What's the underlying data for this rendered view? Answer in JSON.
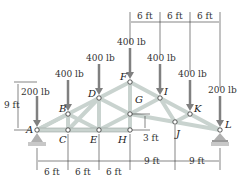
{
  "diagram": {
    "type": "truss",
    "nodes": {
      "A": {
        "label": "A",
        "x": 37,
        "y": 130
      },
      "B": {
        "label": "B",
        "x": 68,
        "y": 114
      },
      "C": {
        "label": "C",
        "x": 68,
        "y": 130
      },
      "D": {
        "label": "D",
        "x": 99,
        "y": 98
      },
      "E": {
        "label": "E",
        "x": 99,
        "y": 130
      },
      "F": {
        "label": "F",
        "x": 130,
        "y": 82
      },
      "G": {
        "label": "G",
        "x": 130,
        "y": 114
      },
      "H": {
        "label": "H",
        "x": 130,
        "y": 130
      },
      "I": {
        "label": "I",
        "x": 160,
        "y": 98
      },
      "J": {
        "label": "J",
        "x": 175,
        "y": 122
      },
      "K": {
        "label": "K",
        "x": 190,
        "y": 114
      },
      "L": {
        "label": "L",
        "x": 220,
        "y": 130
      }
    },
    "loads": {
      "A": "200 lb",
      "B": "400 lb",
      "D": "400 lb",
      "F": "400 lb",
      "I": "400 lb",
      "K": "400 lb",
      "L": "200 lb"
    },
    "dimensions": {
      "bottom_left": [
        "6 ft",
        "6 ft",
        "6 ft"
      ],
      "bottom_right": [
        "9 ft",
        "9 ft"
      ],
      "top_right": [
        "6 ft",
        "6 ft",
        "6 ft"
      ],
      "height_left": "9 ft",
      "offset_GH": "3 ft"
    },
    "colors": {
      "member": "#c9d3cf",
      "member_edge": "#9aa6a2",
      "load_arrow": "#808080",
      "support": "#b0b0b0"
    }
  }
}
